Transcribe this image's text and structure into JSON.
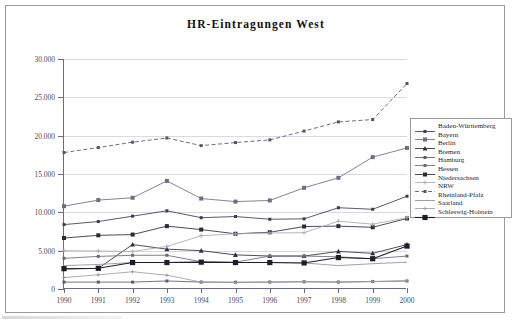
{
  "figure": {
    "title": "HR-Eintragungen West"
  },
  "chart_data": {
    "type": "line",
    "title": "HR-Eintragungen West",
    "xlabel": "",
    "ylabel": "",
    "grid": true,
    "legend_position": "right",
    "ylim": [
      0,
      30000
    ],
    "yticks": [
      0,
      5000,
      10000,
      15000,
      20000,
      25000,
      30000
    ],
    "ytick_labels": [
      "0",
      "5.000",
      "10.000",
      "15.000",
      "20.000",
      "25.000",
      "30.000"
    ],
    "categories": [
      "1990",
      "1991",
      "1992",
      "1993",
      "1994",
      "1995",
      "1996",
      "1997",
      "1998",
      "1999",
      "2000"
    ],
    "series": [
      {
        "name": "Baden-Württemberg",
        "color": "#3c3c4e",
        "marker": "square-small",
        "dash": "solid",
        "values": [
          8400,
          8800,
          9500,
          10200,
          9300,
          9450,
          9100,
          9150,
          10600,
          10400,
          12100
        ]
      },
      {
        "name": "Bayern",
        "color": "#6e6e80",
        "marker": "square-medium",
        "dash": "solid",
        "values": [
          10800,
          11600,
          11900,
          14100,
          11800,
          11400,
          11550,
          13200,
          14500,
          17200,
          18400
        ]
      },
      {
        "name": "Berlin",
        "color": "#2e2e3c",
        "marker": "triangle",
        "dash": "solid",
        "values": [
          2600,
          2700,
          5800,
          5200,
          5000,
          4450,
          4300,
          4300,
          4900,
          4650,
          5800
        ]
      },
      {
        "name": "Bremen",
        "color": "#5a5a6c",
        "marker": "square-small",
        "dash": "solid",
        "values": [
          900,
          900,
          900,
          1050,
          900,
          880,
          900,
          950,
          900,
          980,
          1050
        ]
      },
      {
        "name": "Hamburg",
        "color": "#6a6a7a",
        "marker": "square-small",
        "dash": "solid",
        "values": [
          4000,
          4250,
          4400,
          4400,
          3550,
          3500,
          4300,
          4300,
          4200,
          3950,
          4300
        ]
      },
      {
        "name": "Hessen",
        "color": "#2a2a38",
        "marker": "square-medium",
        "dash": "solid",
        "values": [
          6650,
          7000,
          7100,
          8200,
          7750,
          7200,
          7400,
          8150,
          8200,
          8050,
          9200
        ]
      },
      {
        "name": "Niedersachsen",
        "color": "#a9a9b6",
        "marker": "plus",
        "dash": "solid",
        "values": [
          5000,
          4950,
          4900,
          5550,
          6950,
          7200,
          7300,
          7350,
          8850,
          8450,
          9300
        ]
      },
      {
        "name": "NRW",
        "color": "#55555f",
        "marker": "square-small",
        "dash": "dashed",
        "values": [
          17800,
          18450,
          19150,
          19700,
          18700,
          19100,
          19450,
          20600,
          21800,
          22100,
          26800
        ]
      },
      {
        "name": "Rheinland-Pfalz",
        "color": "#8e8e9c",
        "marker": "none",
        "dash": "solid",
        "values": [
          3050,
          3200,
          3450,
          3450,
          3500,
          3450,
          3450,
          3400,
          3050,
          3300,
          3500
        ]
      },
      {
        "name": "Saarland",
        "color": "#9c9caa",
        "marker": "plus-small",
        "dash": "solid",
        "values": [
          1500,
          1850,
          2250,
          1800,
          900,
          870,
          880,
          950,
          900,
          960,
          1050
        ]
      },
      {
        "name": "Schleswig-Holstein",
        "color": "#1e1e28",
        "marker": "square-large",
        "dash": "solid",
        "values": [
          2650,
          2700,
          3450,
          3450,
          3500,
          3450,
          3450,
          3400,
          4100,
          3950,
          5600
        ]
      }
    ]
  }
}
